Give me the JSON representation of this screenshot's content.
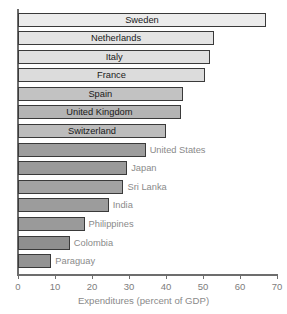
{
  "chart_data": {
    "type": "bar",
    "orientation": "horizontal",
    "title": "",
    "subtitle": "",
    "xlabel": "Expenditures (percent of GDP)",
    "ylabel": "",
    "xlim": [
      0,
      70
    ],
    "xticks": [
      0,
      10,
      20,
      30,
      40,
      50,
      60,
      70
    ],
    "xtick_labels": [
      "0",
      "10",
      "20",
      "30",
      "40",
      "50",
      "60",
      "70"
    ],
    "grid": false,
    "legend": null,
    "categories": [
      "Sweden",
      "Netherlands",
      "Italy",
      "France",
      "Spain",
      "United Kingdom",
      "Switzerland",
      "United States",
      "Japan",
      "Sri Lanka",
      "India",
      "Philippines",
      "Colombia",
      "Paraguay"
    ],
    "values": [
      67,
      53,
      52,
      50.5,
      44.5,
      44,
      40,
      34.5,
      29.5,
      28.5,
      24.5,
      18,
      14,
      9
    ],
    "bars": [
      {
        "label": "Sweden",
        "value": 67,
        "fill": "#ececec",
        "label_position": "inside"
      },
      {
        "label": "Netherlands",
        "value": 53,
        "fill": "#e4e4e4",
        "label_position": "inside"
      },
      {
        "label": "Italy",
        "value": 52,
        "fill": "#e0e0e0",
        "label_position": "inside"
      },
      {
        "label": "France",
        "value": 50.5,
        "fill": "#dcdcdc",
        "label_position": "inside"
      },
      {
        "label": "Spain",
        "value": 44.5,
        "fill": "#c2c2c2",
        "label_position": "inside"
      },
      {
        "label": "United Kingdom",
        "value": 44,
        "fill": "#b4b4b4",
        "label_position": "inside"
      },
      {
        "label": "Switzerland",
        "value": 40,
        "fill": "#bcbcbc",
        "label_position": "inside"
      },
      {
        "label": "United States",
        "value": 34.5,
        "fill": "#9d9d9d",
        "label_position": "outside"
      },
      {
        "label": "Japan",
        "value": 29.5,
        "fill": "#9a9a9a",
        "label_position": "outside"
      },
      {
        "label": "Sri Lanka",
        "value": 28.5,
        "fill": "#a2a2a2",
        "label_position": "outside"
      },
      {
        "label": "India",
        "value": 24.5,
        "fill": "#9c9c9c",
        "label_position": "outside"
      },
      {
        "label": "Philippines",
        "value": 18,
        "fill": "#9a9a9a",
        "label_position": "outside"
      },
      {
        "label": "Colombia",
        "value": 14,
        "fill": "#8f8f8f",
        "label_position": "outside"
      },
      {
        "label": "Paraguay",
        "value": 9,
        "fill": "#939393",
        "label_position": "outside"
      }
    ],
    "colors": {
      "bar_outline": "#3a3a3a",
      "axis": "#6d6d6d",
      "inside_label_text": "#1a1a1a",
      "outside_label_text": "#8a8a8a",
      "tick_label_text": "#7d7d7d",
      "axis_title_text": "#8a8a8a",
      "background": "#ffffff"
    }
  }
}
